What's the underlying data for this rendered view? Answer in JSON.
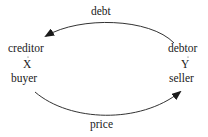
{
  "diagram": {
    "type": "flow",
    "nodes": [
      {
        "id": "left",
        "role_top": "creditor",
        "var": "X",
        "role_bottom": "buyer"
      },
      {
        "id": "right",
        "role_top": "debtor",
        "var": "Y",
        "role_bottom": "seller"
      }
    ],
    "edges": [
      {
        "from": "right",
        "to": "left",
        "label": "debt"
      },
      {
        "from": "left",
        "to": "right",
        "label": "price"
      }
    ],
    "colors": {
      "line": "#333333",
      "text": "#1a1a1a",
      "background": "#ffffff"
    }
  },
  "labels": {
    "debt": "debt",
    "price": "price",
    "creditor": "creditor",
    "x_var": "X",
    "buyer": "buyer",
    "debtor": "debtor",
    "y_var": "Y",
    "seller": "seller"
  }
}
